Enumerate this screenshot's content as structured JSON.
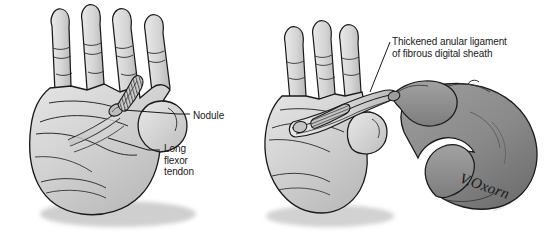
{
  "figure": {
    "background_color": "#ffffff",
    "width": 557,
    "height": 241
  },
  "panels": {
    "left": {
      "name": "palmar-view-panel",
      "description": "Palmar view of left hand with flexor tendon and nodule exposed"
    },
    "right": {
      "name": "examination-panel",
      "description": "Examiner's hand extending the patient's middle finger to show thickened anular ligament"
    }
  },
  "labels": {
    "nodule": "Nodule",
    "long_flexor_tendon": "Long\nflexor\ntendon",
    "thickened_ligament": "Thickened anular ligament\nof fibrous digital sheath"
  },
  "signature": {
    "artist": "V.Oxorn"
  },
  "colors": {
    "outline": "#1a1a1a",
    "light_skin": "#d3d3d3",
    "light_skin_shadow": "#b8b8b8",
    "light_skin_highlight": "#e6e6e6",
    "dark_skin": "#8a8a8a",
    "dark_skin_shadow": "#6e6e6e",
    "dark_skin_highlight": "#9e9e9e",
    "tendon": "#cfcfcf",
    "nodule": "#bdbdbd",
    "ligament_band": "#c4c4c4",
    "drop_shadow": "#c9c9c9",
    "leader_line": "#1a1a1a",
    "text": "#1a1a1a"
  }
}
